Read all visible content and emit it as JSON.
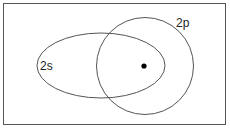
{
  "diagram": {
    "type": "orbital-overlap",
    "frame": {
      "x": 3.5,
      "y": 3.5,
      "width": 222,
      "height": 121,
      "stroke": "#555555"
    },
    "orbitals": [
      {
        "name": "2s",
        "label": "2s",
        "shape": "ellipse",
        "cx": 101,
        "cy": 65.5,
        "rx": 64,
        "ry": 32.5,
        "label_x": 40,
        "label_y": 70
      },
      {
        "name": "2p",
        "label": "2p",
        "shape": "circle",
        "cx": 145,
        "cy": 66,
        "r": 48.5,
        "label_x": 176,
        "label_y": 27
      }
    ],
    "nucleus": {
      "cx": 144,
      "cy": 66,
      "r": 2.6,
      "fill": "#000000"
    },
    "stroke_color": "#555555"
  }
}
